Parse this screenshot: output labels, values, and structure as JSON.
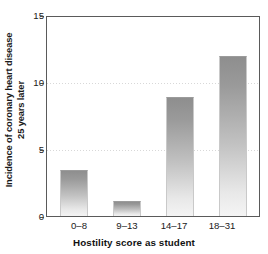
{
  "chart_data": {
    "type": "bar",
    "title": "",
    "subtitle": "",
    "xlabel": "Hostility score as student",
    "ylabel": "Incidence of coronary heart disease 25 years later",
    "ylabel_line1": "Incidence of coronary heart disease",
    "ylabel_line2": "25 years later",
    "categories": [
      "0–8",
      "9–13",
      "14–17",
      "18–31"
    ],
    "values": [
      3.5,
      1.1,
      9.0,
      12.1
    ],
    "series": [
      {
        "name": "Incidence of coronary heart disease 25 years later",
        "values": [
          3.5,
          1.1,
          9.0,
          12.1
        ]
      }
    ],
    "ylim": [
      0,
      15
    ],
    "yticks": [
      0,
      5,
      10,
      15
    ],
    "ytick_labels": [
      "0",
      "5",
      "10",
      "15"
    ],
    "xlim_categories": 4,
    "grid": true,
    "grid_axis": "y",
    "grid_style": "dotted",
    "gridline_values": [
      5,
      10
    ],
    "legend": false,
    "legend_position": "none",
    "bar_fill": "#b0b0b0",
    "bar_gradient_top": "#8e8e8e",
    "bar_gradient_bottom": "#f4f4f4",
    "axis_color": "#5a5a5a",
    "text_color": "#1a1a1a",
    "background": "#ffffff",
    "annotations": []
  },
  "axes": {
    "y_ticks": [
      {
        "label": "15",
        "value": 15
      },
      {
        "label": "10",
        "value": 10
      },
      {
        "label": "5",
        "value": 5
      },
      {
        "label": "0",
        "value": 0
      }
    ],
    "x_ticks": [
      {
        "label": "0–8"
      },
      {
        "label": "9–13"
      },
      {
        "label": "14–17"
      },
      {
        "label": "18–31"
      }
    ]
  }
}
